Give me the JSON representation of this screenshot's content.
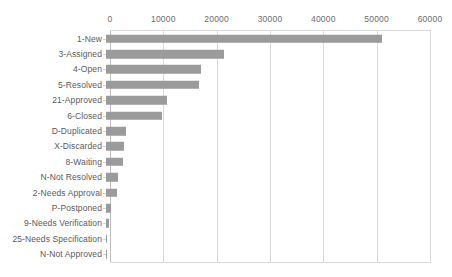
{
  "chart_data": {
    "type": "bar",
    "orientation": "horizontal",
    "title": "",
    "xlabel": "",
    "ylabel": "",
    "xlim": [
      0,
      60000
    ],
    "grid": true,
    "legend": false,
    "axis_position": "top",
    "bar_color": "#9b9b9b",
    "gridline_color": "#d9d9d9",
    "text_color": "#5a5a5a",
    "xticks": [
      0,
      10000,
      20000,
      30000,
      40000,
      50000,
      60000
    ],
    "xtick_labels": [
      "0",
      "10000",
      "20000",
      "30000",
      "40000",
      "50000",
      "60000"
    ],
    "categories": [
      "1-New",
      "3-Assigned",
      "4-Open",
      "5-Resolved",
      "21-Approved",
      "6-Closed",
      "D-Duplicated",
      "X-Discarded",
      "8-Waiting",
      "N-Not Resolved",
      "2-Needs Approval",
      "P-Postponed",
      "9-Needs Verification",
      "25-Needs Specification",
      "N-Not Approved"
    ],
    "values": [
      51700,
      22200,
      17800,
      17500,
      11400,
      10500,
      3700,
      3400,
      3200,
      2200,
      2050,
      900,
      600,
      120,
      80
    ]
  }
}
